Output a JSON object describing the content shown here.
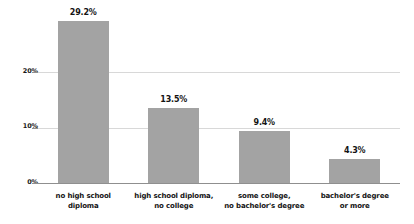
{
  "chart_data": {
    "type": "bar",
    "title": "",
    "subtitle": "",
    "xlabel": "",
    "ylabel": "",
    "ylim": [
      0,
      30
    ],
    "yticks": [
      "0%",
      "10%",
      "20%"
    ],
    "ytick_values": [
      0,
      10,
      20
    ],
    "grid": true,
    "legend": "none",
    "orientation": "vertical",
    "bar_color": "#a3a3a3",
    "gridline_color": "#d8d8d8",
    "axis_color": "#8f8f8f",
    "label_color": "#141414",
    "categories": [
      "no high school diploma",
      "high school diploma, no college",
      "some college, no bachelor's degree",
      "bachelor's degree or more"
    ],
    "category_lines": [
      [
        "no high school",
        "diploma"
      ],
      [
        "high school diploma,",
        "no college"
      ],
      [
        "some college,",
        "no bachelor's degree"
      ],
      [
        "bachelor's degree",
        "or more"
      ]
    ],
    "values": [
      29.2,
      13.5,
      9.4,
      4.3
    ],
    "value_labels": [
      "29.2%",
      "13.5%",
      "9.4%",
      "4.3%"
    ]
  }
}
